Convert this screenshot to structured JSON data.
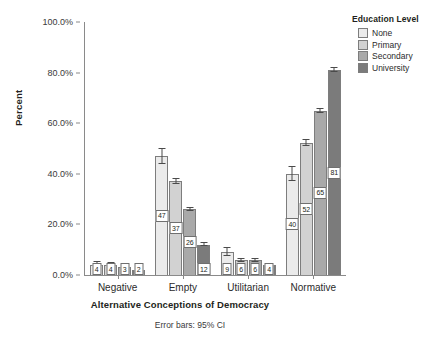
{
  "chart_data": {
    "type": "bar",
    "title": "",
    "xlabel": "Alternative Conceptions of Democracy",
    "ylabel": "Percent",
    "categories": [
      "Negative",
      "Empty",
      "Utilitarian",
      "Normative"
    ],
    "ylim": [
      0,
      100
    ],
    "ytick_labels": [
      "0.0%",
      "20.0%",
      "40.0%",
      "60.0%",
      "80.0%",
      "100.0%"
    ],
    "ytick_values": [
      0,
      20,
      40,
      60,
      80,
      100
    ],
    "grid": false,
    "legend_position": "top-right",
    "legend_title": "Education Level",
    "footnote": "Error bars: 95% CI",
    "series": [
      {
        "name": "None",
        "color": "#ebebeb",
        "values": [
          4,
          47,
          9,
          40
        ],
        "labels": [
          "4",
          "47",
          "9",
          "40"
        ],
        "ci_low": [
          3.2,
          44.0,
          7.4,
          37.0
        ],
        "ci_high": [
          5.4,
          50.3,
          11.0,
          43.2
        ]
      },
      {
        "name": "Primary",
        "color": "#d2d2d2",
        "values": [
          4,
          37,
          6,
          52
        ],
        "labels": [
          "4",
          "37",
          "6",
          "52"
        ],
        "ci_low": [
          3.5,
          35.8,
          5.2,
          51.0
        ],
        "ci_high": [
          5.0,
          38.5,
          6.9,
          53.7
        ]
      },
      {
        "name": "Secondary",
        "color": "#a9a9a9",
        "values": [
          3,
          26,
          6,
          65
        ],
        "labels": [
          "3",
          "26",
          "6",
          "65"
        ],
        "ci_low": [
          2.6,
          25.2,
          5.3,
          64.0
        ],
        "ci_high": [
          3.6,
          26.7,
          6.6,
          66.2
        ]
      },
      {
        "name": "University",
        "color": "#7b7b7b",
        "values": [
          2,
          12,
          4,
          81
        ],
        "labels": [
          "2",
          "12",
          "4",
          "81"
        ],
        "ci_low": [
          1.8,
          11.4,
          3.7,
          80.2
        ],
        "ci_high": [
          2.7,
          13.1,
          4.6,
          82.1
        ]
      }
    ]
  }
}
